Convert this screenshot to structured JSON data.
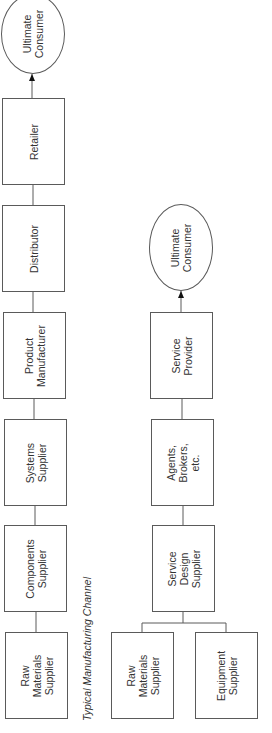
{
  "diagram": {
    "manufacturing_channel": {
      "caption": "Typical Manufacturing Channel",
      "nodes": [
        {
          "id": "ultimate-consumer",
          "label": "Ultimate\nConsumer",
          "shape": "ellipse"
        },
        {
          "id": "retailer",
          "label": "Retailer",
          "shape": "box"
        },
        {
          "id": "distributor",
          "label": "Distributor",
          "shape": "box"
        },
        {
          "id": "product-manufacturer",
          "label": "Product\nManufacturer",
          "shape": "box"
        },
        {
          "id": "systems-supplier",
          "label": "Systems\nSupplier",
          "shape": "box"
        },
        {
          "id": "components-supplier",
          "label": "Components\nSupplier",
          "shape": "box"
        },
        {
          "id": "raw-materials-supplier",
          "label": "Raw\nMaterials\nSupplier",
          "shape": "box"
        }
      ],
      "flow": "Raw Materials Supplier → Components Supplier → Systems Supplier → Product Manufacturer → Distributor → Retailer → Ultimate Consumer"
    },
    "service_channel": {
      "nodes": [
        {
          "id": "ultimate-consumer",
          "label": "Ultimate\nConsumer",
          "shape": "ellipse"
        },
        {
          "id": "service-provider",
          "label": "Service\nProvider",
          "shape": "box"
        },
        {
          "id": "agents-brokers",
          "label": "Agents,\nBrokers,\netc.",
          "shape": "box"
        },
        {
          "id": "service-design-supplier",
          "label": "Service\nDesign\nSupplier",
          "shape": "box"
        },
        {
          "id": "raw-materials-supplier",
          "label": "Raw\nMaterials\nSupplier",
          "shape": "box"
        },
        {
          "id": "equipment-supplier",
          "label": "Equipment\nSupplier",
          "shape": "box"
        }
      ],
      "flow": "Raw Materials Supplier + Equipment Supplier → Service Design Supplier → Agents, Brokers, etc. → Service Provider → Ultimate Consumer"
    },
    "colors": {
      "line": "#5a5a5a",
      "text": "#333333",
      "background": "#ffffff"
    }
  }
}
